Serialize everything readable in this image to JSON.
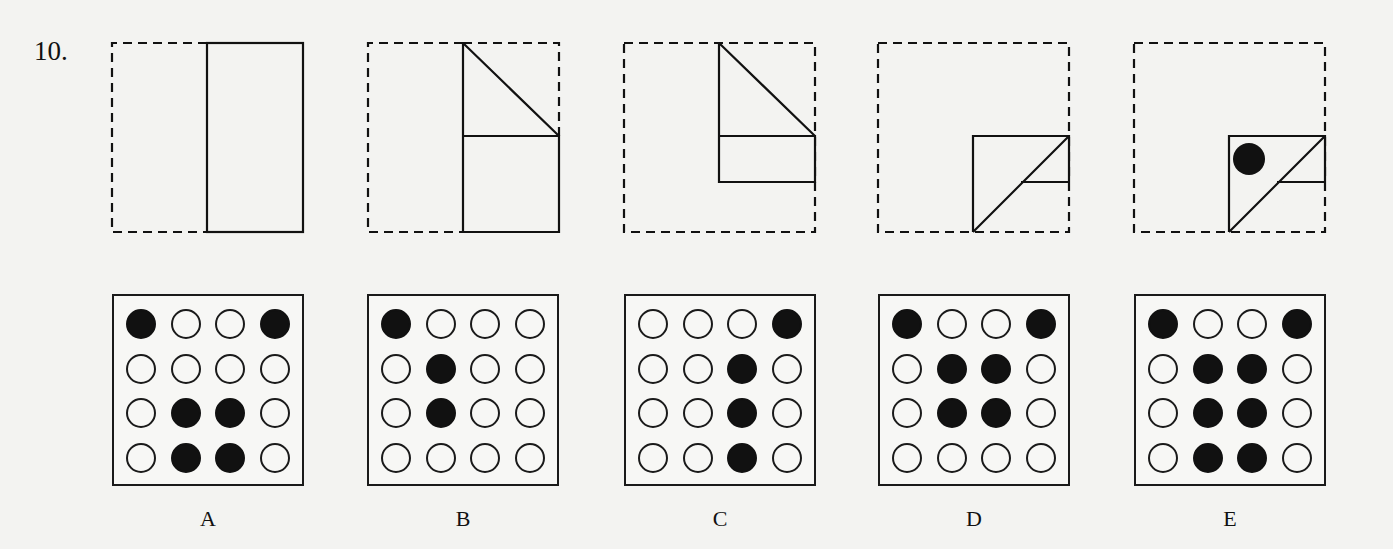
{
  "question": {
    "number": "10."
  },
  "fold_steps": [
    {
      "step": 1,
      "description": "Left half of square folded over onto right half",
      "hole": false
    },
    {
      "step": 2,
      "description": "Top-right corner folded down along diagonal",
      "hole": false
    },
    {
      "step": 3,
      "description": "Bottom portion folded up",
      "hole": false
    },
    {
      "step": 4,
      "description": "Top portion folded down along diagonal",
      "hole": false
    },
    {
      "step": 5,
      "description": "Hole punched through folded paper",
      "hole": true
    }
  ],
  "answers": [
    {
      "label": "A",
      "grid": [
        [
          1,
          0,
          0,
          1
        ],
        [
          0,
          0,
          0,
          0
        ],
        [
          0,
          1,
          1,
          0
        ],
        [
          0,
          1,
          1,
          0
        ]
      ]
    },
    {
      "label": "B",
      "grid": [
        [
          1,
          0,
          0,
          0
        ],
        [
          0,
          1,
          0,
          0
        ],
        [
          0,
          1,
          0,
          0
        ],
        [
          0,
          0,
          0,
          0
        ]
      ]
    },
    {
      "label": "C",
      "grid": [
        [
          0,
          0,
          0,
          1
        ],
        [
          0,
          0,
          1,
          0
        ],
        [
          0,
          0,
          1,
          0
        ],
        [
          0,
          0,
          1,
          0
        ]
      ]
    },
    {
      "label": "D",
      "grid": [
        [
          1,
          0,
          0,
          1
        ],
        [
          0,
          1,
          1,
          0
        ],
        [
          0,
          1,
          1,
          0
        ],
        [
          0,
          0,
          0,
          0
        ]
      ]
    },
    {
      "label": "E",
      "grid": [
        [
          1,
          0,
          0,
          1
        ],
        [
          0,
          1,
          1,
          0
        ],
        [
          0,
          1,
          1,
          0
        ],
        [
          0,
          1,
          1,
          0
        ]
      ]
    }
  ],
  "colors": {
    "background": "#f3f3f1",
    "ink": "#111111"
  }
}
